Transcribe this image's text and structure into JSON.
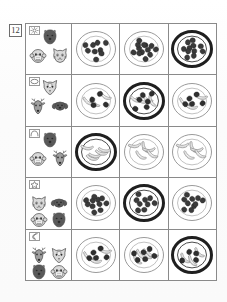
{
  "worksheet": {
    "problem_number": "12",
    "rows": [
      {
        "badge_icon": "sun-icon",
        "faces": [
          {
            "name": "bear-face-dark",
            "shade": "dark"
          },
          {
            "name": "monkey-face-light",
            "shade": "light"
          },
          {
            "name": "cat-face-light",
            "shade": "light"
          }
        ],
        "options": [
          {
            "name": "plate-beans-sparse",
            "food": "beans",
            "count": 9,
            "selected": false,
            "rim": "thin"
          },
          {
            "name": "plate-beans-dense",
            "food": "beans",
            "count": 13,
            "selected": false,
            "rim": "thin"
          },
          {
            "name": "plate-beans-bowl",
            "food": "beans",
            "count": 11,
            "selected": true,
            "rim": "thick"
          }
        ]
      },
      {
        "badge_icon": "cloud-icon",
        "faces": [
          {
            "name": "fox-face-light",
            "shade": "light"
          },
          {
            "name": "deer-face-mid",
            "shade": "mid"
          },
          {
            "name": "dog-face-dark",
            "shade": "dark"
          }
        ],
        "options": [
          {
            "name": "plate-banana-beans-a",
            "food": "banana-beans",
            "count": 4,
            "selected": false,
            "rim": "thin"
          },
          {
            "name": "plate-banana-beans-bowl",
            "food": "banana-beans",
            "count": 6,
            "selected": true,
            "rim": "thick"
          },
          {
            "name": "plate-banana-beans-c",
            "food": "banana-beans",
            "count": 5,
            "selected": false,
            "rim": "thin"
          }
        ]
      },
      {
        "badge_icon": "arch-icon",
        "faces": [
          {
            "name": "bear-face-dark",
            "shade": "dark"
          },
          {
            "name": "monkey-face-light",
            "shade": "light"
          },
          {
            "name": "deer-face-mid",
            "shade": "mid"
          }
        ],
        "options": [
          {
            "name": "plate-bananas-bowl",
            "food": "bananas",
            "count": 5,
            "selected": true,
            "rim": "thick"
          },
          {
            "name": "plate-bananas-b",
            "food": "bananas",
            "count": 5,
            "selected": false,
            "rim": "thin"
          },
          {
            "name": "plate-bananas-c",
            "food": "bananas",
            "count": 5,
            "selected": false,
            "rim": "thin"
          }
        ]
      },
      {
        "badge_icon": "star-icon",
        "faces": [
          {
            "name": "cat-face-light",
            "shade": "light"
          },
          {
            "name": "dog-face-dark",
            "shade": "dark"
          },
          {
            "name": "monkey-face-light",
            "shade": "light"
          },
          {
            "name": "bear-face-dark",
            "shade": "dark"
          }
        ],
        "options": [
          {
            "name": "plate-beans-sparse",
            "food": "beans",
            "count": 11,
            "selected": false,
            "rim": "thin"
          },
          {
            "name": "plate-beans-bowl",
            "food": "beans",
            "count": 9,
            "selected": true,
            "rim": "thick"
          },
          {
            "name": "plate-beans-c",
            "food": "beans",
            "count": 10,
            "selected": false,
            "rim": "thin"
          }
        ]
      },
      {
        "badge_icon": "moon-icon",
        "faces": [
          {
            "name": "deer-face-mid",
            "shade": "mid"
          },
          {
            "name": "fox-face-light",
            "shade": "light"
          },
          {
            "name": "bear-face-dark",
            "shade": "dark"
          },
          {
            "name": "monkey-face-light",
            "shade": "light"
          }
        ],
        "options": [
          {
            "name": "plate-banana-beans-a",
            "food": "banana-beans",
            "count": 5,
            "selected": false,
            "rim": "thin"
          },
          {
            "name": "plate-banana-beans-b",
            "food": "banana-beans",
            "count": 6,
            "selected": false,
            "rim": "thin"
          },
          {
            "name": "plate-banana-beans-bowl",
            "food": "banana-beans",
            "count": 4,
            "selected": true,
            "rim": "thick"
          }
        ]
      }
    ]
  },
  "colors": {
    "ink": "#2b2b2b",
    "rule": "#8a8a8a",
    "rim_thin": "#8e8e8e",
    "rim_thick": "#1f1f1f",
    "fill_light": "#d9d9d9",
    "fill_mid": "#9e9e9e",
    "fill_dark": "#5a5a5a",
    "paper": "#ffffff"
  }
}
